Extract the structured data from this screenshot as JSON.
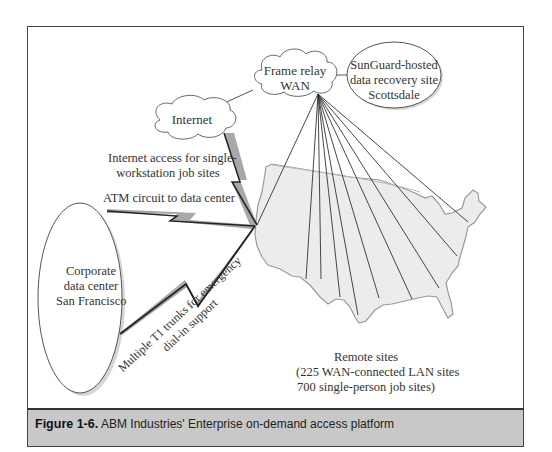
{
  "nodes": {
    "frame_relay": {
      "line1": "Frame relay",
      "line2": "WAN"
    },
    "sunguard": {
      "line1": "SunGuard-hosted",
      "line2": "data recovery site",
      "line3": "Scottsdale"
    },
    "internet": {
      "label": "Internet"
    },
    "corporate": {
      "line1": "Corporate",
      "line2": "data center",
      "line3": "San Francisco"
    }
  },
  "links": {
    "internet_access": {
      "line1": "Internet access for single-",
      "line2": "workstation job sites"
    },
    "atm": {
      "label": "ATM circuit to data center"
    },
    "t1": {
      "line1": "Multiple T1 trunks for emergency",
      "line2": "dial-in support"
    }
  },
  "remote_sites": {
    "line1": "Remote sites",
    "line2": "(225 WAN-connected LAN sites",
    "line3": "700 single-person job sites)"
  },
  "caption": {
    "number": "Figure 1-6.",
    "text": "ABM Industries' Enterprise on-demand access platform"
  },
  "colors": {
    "map_fill": "#ededed",
    "map_stroke": "#999999",
    "bolt_fill": "#a8a8a8",
    "caption_bg": "#c8c8c8"
  }
}
